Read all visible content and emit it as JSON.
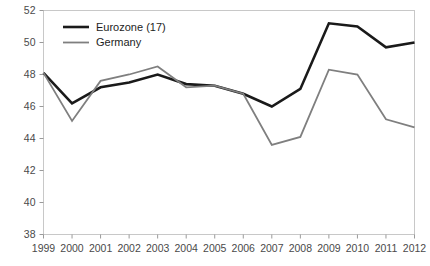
{
  "chart_data": {
    "type": "line",
    "title": "",
    "subtitle": "",
    "xlabel": "",
    "ylabel": "",
    "categories": [
      "1999",
      "2000",
      "2001",
      "2002",
      "2003",
      "2004",
      "2005",
      "2006",
      "2007",
      "2008",
      "2009",
      "2010",
      "2011",
      "2012"
    ],
    "x": [
      1999,
      2000,
      2001,
      2002,
      2003,
      2004,
      2005,
      2006,
      2007,
      2008,
      2009,
      2010,
      2011,
      2012
    ],
    "series": [
      {
        "name": "Eurozone (17)",
        "color": "#1a1a1a",
        "width": 2.6,
        "values": [
          48.1,
          46.2,
          47.2,
          47.5,
          48.0,
          47.4,
          47.3,
          46.8,
          46.0,
          47.1,
          51.2,
          51.0,
          49.7,
          50.0
        ]
      },
      {
        "name": "Germany",
        "color": "#7f7f7f",
        "width": 1.8,
        "values": [
          48.1,
          45.1,
          47.6,
          48.0,
          48.5,
          47.2,
          47.3,
          46.8,
          43.6,
          44.1,
          48.3,
          48.0,
          45.2,
          44.7
        ]
      }
    ],
    "ylim": [
      38,
      52
    ],
    "yticks": [
      38,
      40,
      42,
      44,
      46,
      48,
      50,
      52
    ],
    "ytick_labels": [
      "38",
      "40",
      "42",
      "44",
      "46",
      "48",
      "50",
      "52"
    ],
    "grid": false,
    "legend_position": "top-left",
    "axis_color": "#c8c8c8",
    "tick_color": "#9a9a9a",
    "background": "#ffffff"
  },
  "legend": {
    "entries": [
      {
        "label": "Eurozone (17)"
      },
      {
        "label": "Germany"
      }
    ]
  }
}
